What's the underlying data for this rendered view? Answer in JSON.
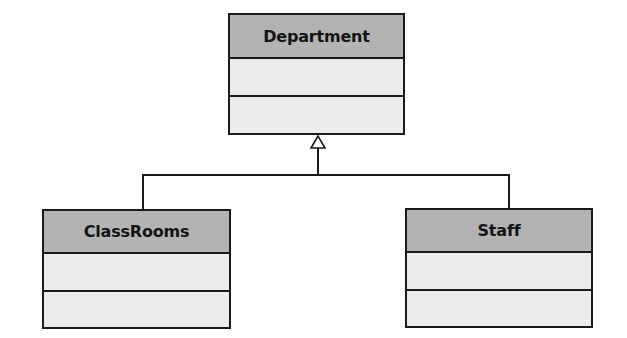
{
  "diagram": {
    "type": "UML class diagram (generalization)",
    "classes": [
      {
        "name": "Department",
        "attributes": [],
        "operations": []
      },
      {
        "name": "ClassRooms",
        "attributes": [],
        "operations": []
      },
      {
        "name": "Staff",
        "attributes": [],
        "operations": []
      }
    ],
    "relationships": [
      {
        "type": "generalization",
        "from": "ClassRooms",
        "to": "Department"
      },
      {
        "type": "generalization",
        "from": "Staff",
        "to": "Department"
      }
    ]
  },
  "colors": {
    "header_fill": "#b3b3b3",
    "body_fill": "#ececec",
    "stroke": "#1a1a1a"
  }
}
